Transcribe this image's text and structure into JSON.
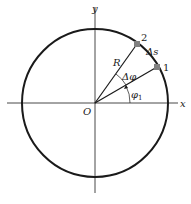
{
  "diagram": {
    "colors": {
      "stroke": "#1a1a1a",
      "point": "#808080",
      "background": "#ffffff"
    },
    "axes": {
      "x_label": "x",
      "y_label": "y",
      "origin_label": "O"
    },
    "circle": {
      "radius_label": "R"
    },
    "points": [
      {
        "id": "1",
        "label": "1",
        "angle_deg": 29
      },
      {
        "id": "2",
        "label": "2",
        "angle_deg": 57
      }
    ],
    "annotations": {
      "arc_length": "Δs",
      "delta_angle": "Δφ",
      "angle_1_symbol": "φ",
      "angle_1_subscript": "1"
    }
  }
}
